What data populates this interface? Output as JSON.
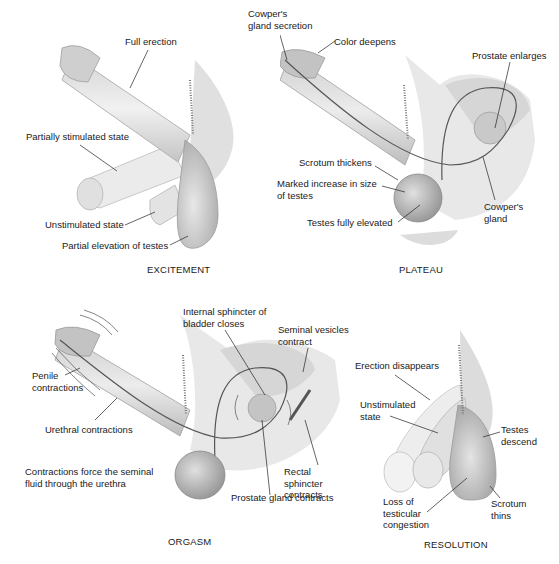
{
  "diagram": {
    "type": "anatomical-illustration",
    "panels": [
      {
        "id": "excitement",
        "title": "EXCITEMENT",
        "labels": [
          "Full erection",
          "Partially stimulated state",
          "Unstimulated state",
          "Partial elevation of testes"
        ]
      },
      {
        "id": "plateau",
        "title": "PLATEAU",
        "labels": [
          "Cowper's\ngland secretion",
          "Color deepens",
          "Prostate enlarges",
          "Scrotum thickens",
          "Marked increase in size\nof testes",
          "Testes fully elevated",
          "Cowper's\ngland"
        ]
      },
      {
        "id": "orgasm",
        "title": "ORGASM",
        "labels": [
          "Internal sphincter of\nbladder closes",
          "Seminal vesicles\ncontract",
          "Penile\ncontractions",
          "Urethral contractions",
          "Contractions force the seminal\nfluid through the urethra",
          "Rectal sphincter\ncontracts",
          "Prostate gland contracts"
        ]
      },
      {
        "id": "resolution",
        "title": "RESOLUTION",
        "labels": [
          "Erection disappears",
          "Unstimulated\nstate",
          "Testes\ndescend",
          "Loss of\ntesticular\ncongestion",
          "Scrotum\nthins"
        ]
      }
    ]
  },
  "colors": {
    "tissue_light": "#e6e6e6",
    "tissue_mid": "#cfcfcf",
    "tissue_dark": "#a9a9a9",
    "outline": "#8a8a8a",
    "leader": "#222222",
    "duct": "#555555"
  }
}
